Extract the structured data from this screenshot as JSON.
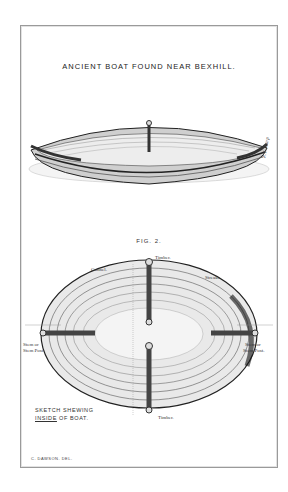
{
  "plate": {
    "title": "ANCIENT BOAT FOUND NEAR BEXHILL.",
    "figures": [
      {
        "label": "FIG. I",
        "description": "perspective view of boat"
      },
      {
        "label": "FIG. 2.",
        "description": "plan view of boat interior"
      }
    ],
    "fig2_labels": {
      "timber_top": "Timber.",
      "gunnel": "Gunnel.",
      "streaks": "Streaks.",
      "stem_left_1": "Stem or",
      "stem_left_2": "Stem Post.",
      "stem_right_1": "Stem or",
      "stem_right_2": "Stem Post.",
      "timber_bottom": "Timber."
    },
    "caption": {
      "line1": "SKETCH SHEWING",
      "line2_underlined": "INSIDE",
      "line2_rest": " OF BOAT."
    },
    "artist_signature": "R.T. Sharp",
    "credit": "C. DAWSON. DEL."
  }
}
